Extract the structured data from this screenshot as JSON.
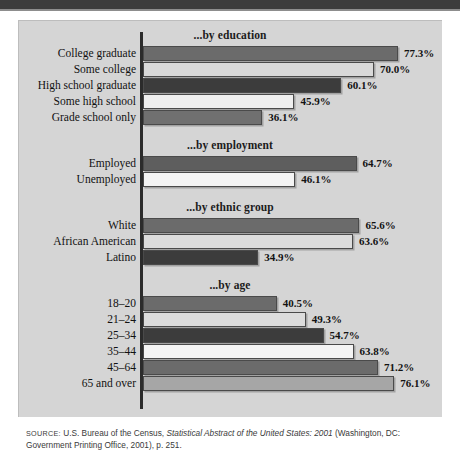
{
  "figure": {
    "background_color": "#d5d5d5",
    "axis_color": "#2b2b2b",
    "source_prefix": "SOURCE:",
    "source_part1": " U.S. Bureau of the Census, ",
    "source_italic": "Statistical Abstract of the United States: 2001",
    "source_part2": " (Washington, DC: Government Printing Office, 2001), p. 251."
  },
  "chart_data": {
    "type": "bar",
    "orientation": "horizontal",
    "title": "",
    "xlabel": "",
    "ylabel": "",
    "xlim": [
      0,
      100
    ],
    "grid": false,
    "legend": "none",
    "value_suffix": "%",
    "sections": [
      {
        "title": "...by education",
        "categories": [
          "College graduate",
          "Some college",
          "High school graduate",
          "Some high school",
          "Grade school only"
        ],
        "values": [
          77.3,
          70.0,
          60.1,
          45.9,
          36.1
        ],
        "labels": [
          "77.3%",
          "70.0%",
          "60.1%",
          "45.9%",
          "36.1%"
        ],
        "colors": [
          "#6b6b6b",
          "#d9d9d9",
          "#3c3c3c",
          "#efefef",
          "#707070"
        ]
      },
      {
        "title": "...by employment",
        "categories": [
          "Employed",
          "Unemployed"
        ],
        "values": [
          64.7,
          46.1
        ],
        "labels": [
          "64.7%",
          "46.1%"
        ],
        "colors": [
          "#5e5e5e",
          "#f4f4f4"
        ]
      },
      {
        "title": "...by ethnic group",
        "categories": [
          "White",
          "African American",
          "Latino"
        ],
        "values": [
          65.6,
          63.6,
          34.9
        ],
        "labels": [
          "65.6%",
          "63.6%",
          "34.9%"
        ],
        "colors": [
          "#6b6b6b",
          "#dcdcdc",
          "#3c3c3c"
        ]
      },
      {
        "title": "...by age",
        "categories": [
          "18–20",
          "21–24",
          "25–34",
          "35–44",
          "45–64",
          "65 and over"
        ],
        "values": [
          40.5,
          49.3,
          54.7,
          63.8,
          71.2,
          76.1
        ],
        "labels": [
          "40.5%",
          "49.3%",
          "54.7%",
          "63.8%",
          "71.2%",
          "76.1%"
        ],
        "colors": [
          "#6b6b6b",
          "#dcdcdc",
          "#3c3c3c",
          "#f4f4f4",
          "#6b6b6b",
          "#a6a6a6"
        ]
      }
    ]
  }
}
